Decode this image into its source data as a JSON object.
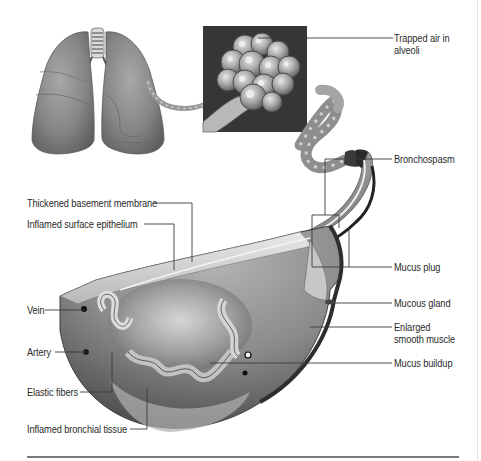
{
  "figure": {
    "components": {
      "lungs": "lungs-illustration",
      "alveoli_inset": "alveoli-cluster-inset",
      "bronchial_tube": "winding-bronchiole",
      "cross_section": "bronchus-cross-section"
    }
  },
  "labels": {
    "trapped_air_line1": "Trapped air in",
    "trapped_air_line2": "alveoli",
    "bronchospasm": "Bronchospasm",
    "thickened_membrane": "Thickened basement membrane",
    "inflamed_epithelium": "Inflamed surface epithelium",
    "mucus_plug": "Mucus plug",
    "mucous_gland": "Mucous gland",
    "enlarged_muscle_line1": "Enlarged",
    "enlarged_muscle_line2": "smooth muscle",
    "vein": "Vein",
    "artery": "Artery",
    "mucus_buildup": "Mucus buildup",
    "elastic_fibers": "Elastic fibers",
    "inflamed_tissue": "Inflamed bronchial tissue"
  },
  "colors": {
    "leader_line": "#3a3a3a",
    "label_text": "#2a2a2a",
    "bottom_rule": "#7a7a7a"
  }
}
